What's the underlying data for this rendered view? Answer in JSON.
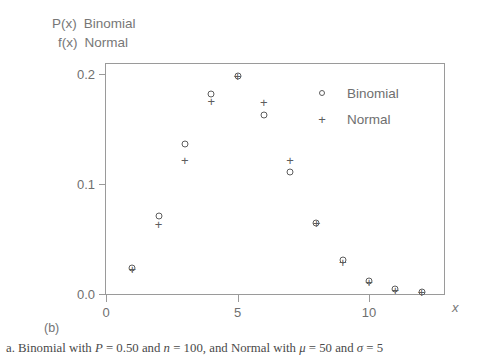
{
  "axis_names": {
    "line1_symbol": "P(x)",
    "line1_name": "Binomial",
    "line2_symbol": "f(x)",
    "line2_name": "Normal"
  },
  "legend": {
    "items": [
      {
        "marker": "circle-marker",
        "label": "Binomial"
      },
      {
        "marker": "plus-marker",
        "label": "Normal"
      }
    ]
  },
  "subfigure_label": "(b)",
  "caption": "a.  Binomial with P = 0.50 and n = 100, and Normal with μ = 50 and σ = 5",
  "colors": {
    "axis": "#9a9a9a",
    "marker": "#5d5d5d",
    "text": "#6f6f6f"
  },
  "chart_data": {
    "type": "scatter",
    "title": "",
    "xlabel": "x",
    "ylabel": "",
    "xlim": [
      0,
      12.85
    ],
    "ylim": [
      0,
      0.2095
    ],
    "xticks": [
      0,
      5,
      10
    ],
    "xticklabels": [
      "0",
      "5",
      "10"
    ],
    "yticks": [
      0.0,
      0.1,
      0.2
    ],
    "yticklabels": [
      "0.0",
      "0.1",
      "0.2"
    ],
    "grid": false,
    "legend_position": "upper-right-inside",
    "x": [
      1,
      2,
      3,
      4,
      5,
      6,
      7,
      8,
      9,
      10,
      11,
      12
    ],
    "series": [
      {
        "name": "Binomial",
        "marker": "circle",
        "values": [
          0.024,
          0.071,
          0.137,
          0.182,
          0.199,
          0.163,
          0.111,
          0.065,
          0.031,
          0.012,
          0.005,
          0.002
        ]
      },
      {
        "name": "Normal",
        "marker": "plus",
        "values": [
          0.023,
          0.064,
          0.122,
          0.176,
          0.199,
          0.175,
          0.122,
          0.065,
          0.029,
          0.011,
          0.004,
          0.002
        ]
      }
    ]
  }
}
